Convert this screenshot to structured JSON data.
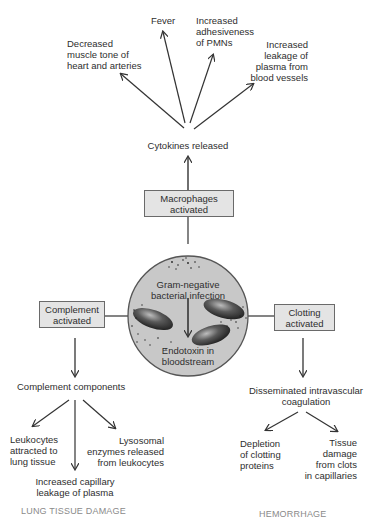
{
  "diagram": {
    "top_effects": [
      {
        "id": "decreased-muscle-tone",
        "text": [
          "Decreased",
          "muscle tone of",
          "heart and arteries"
        ]
      },
      {
        "id": "fever",
        "text": [
          "Fever"
        ]
      },
      {
        "id": "increased-adhesiveness",
        "text": [
          "Increased",
          "adhesiveness",
          "of PMNs"
        ]
      },
      {
        "id": "increased-leakage",
        "text": [
          "Increased",
          "leakage of",
          "plasma from",
          "blood vessels"
        ]
      }
    ],
    "cytokines": "Cytokines released",
    "macrophages": [
      "Macrophages",
      "activated"
    ],
    "center": {
      "top": [
        "Gram-negative",
        "bacterial infection"
      ],
      "bottom": [
        "Endotoxin in",
        "bloodstream"
      ]
    },
    "complement": {
      "box": [
        "Complement",
        "activated"
      ],
      "result": "Complement components",
      "effects": [
        [
          "Leukocytes",
          "attracted to",
          "lung tissue"
        ],
        [
          "Increased capillary",
          "leakage of plasma"
        ],
        [
          "Lysosomal",
          "enzymes released",
          "from leukocytes"
        ]
      ],
      "outcome": "LUNG TISSUE DAMAGE"
    },
    "clotting": {
      "box": [
        "Clotting",
        "activated"
      ],
      "result": [
        "Disseminated intravascular",
        "coagulation"
      ],
      "effects": [
        [
          "Depletion",
          "of clotting",
          "proteins"
        ],
        [
          "Tissue",
          "damage",
          "from clots",
          "in capillaries"
        ]
      ],
      "outcome": "HEMORRHAGE"
    },
    "colors": {
      "box_fill": "#e4e4e4",
      "circle_fill": "#c8c8c8",
      "line": "#333333",
      "outcome_text": "#8a8a8a"
    }
  }
}
